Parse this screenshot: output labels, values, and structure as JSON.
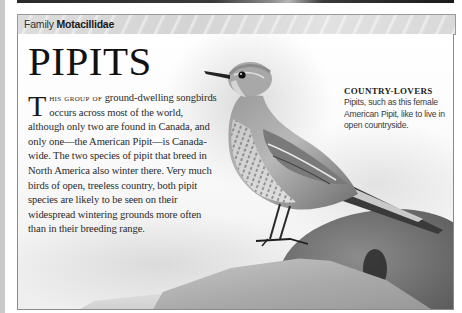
{
  "family_bar": {
    "prefix": "Family",
    "name": "Motacillidae"
  },
  "article": {
    "title": "PIPITS",
    "dropcap": "T",
    "lead_smallcaps": "his group of",
    "body_rest": " ground-dwelling songbirds occurs across most of the world, although only two are found in Canada, and only one—the American Pipit—is Canada-wide. The two species of pipit that breed in North America also winter there. Very much birds of open, treeless country, both pipit species are likely to be seen on their widespread wintering grounds more often than in their breeding range."
  },
  "caption": {
    "title": "COUNTRY-LOVERS",
    "text": "Pipits, such as this female American Pipit, like to live in open countryside."
  },
  "photo": {
    "subject": "female American Pipit perched on rock",
    "palette": "grayscale"
  },
  "colors": {
    "page_bg": "#ffffff",
    "bar_bg": "#d8d8d8",
    "border": "#8a8a8a",
    "text": "#2a2a2a",
    "left_strip": "#c9c9c9"
  }
}
